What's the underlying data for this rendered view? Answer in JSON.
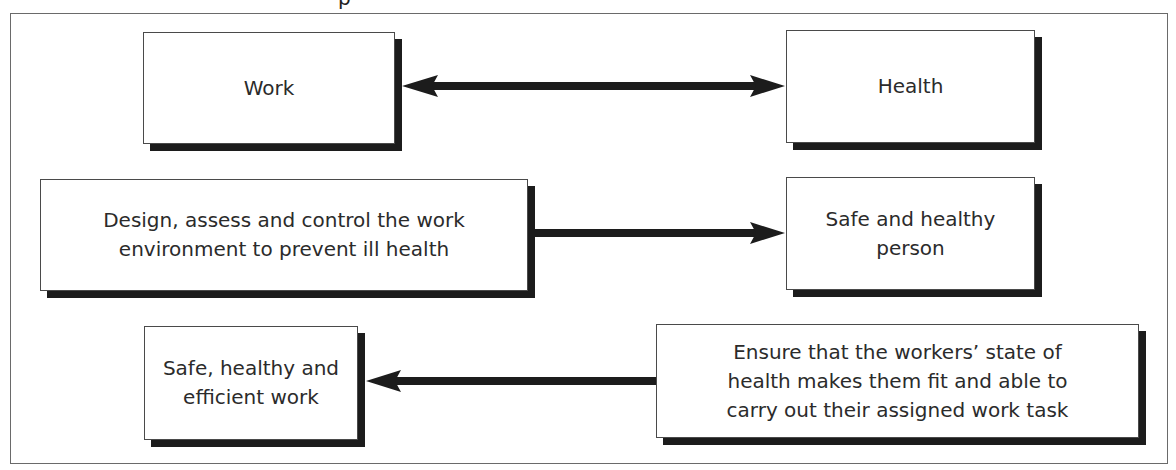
{
  "diagram": {
    "title_fragment": "p",
    "boxes": {
      "work": "Work",
      "health": "Health",
      "design": "Design, assess and control the work\nenvironment to prevent ill health",
      "safe_person": "Safe and healthy\nperson",
      "safe_work": "Safe, healthy and\nefficient work",
      "ensure": "Ensure that the workers’ state of\nhealth makes them fit and able to\ncarry out their assigned work task"
    },
    "connections": [
      {
        "from": "work",
        "to": "health",
        "type": "bidirectional"
      },
      {
        "from": "design",
        "to": "safe_person",
        "type": "directed"
      },
      {
        "from": "ensure",
        "to": "safe_work",
        "type": "directed"
      }
    ],
    "colors": {
      "box_border": "#4a4a4a",
      "shadow": "#1c1c1c",
      "arrow": "#1c1c1c",
      "frame": "#6a6a6a",
      "text": "#2b2b2b"
    }
  }
}
